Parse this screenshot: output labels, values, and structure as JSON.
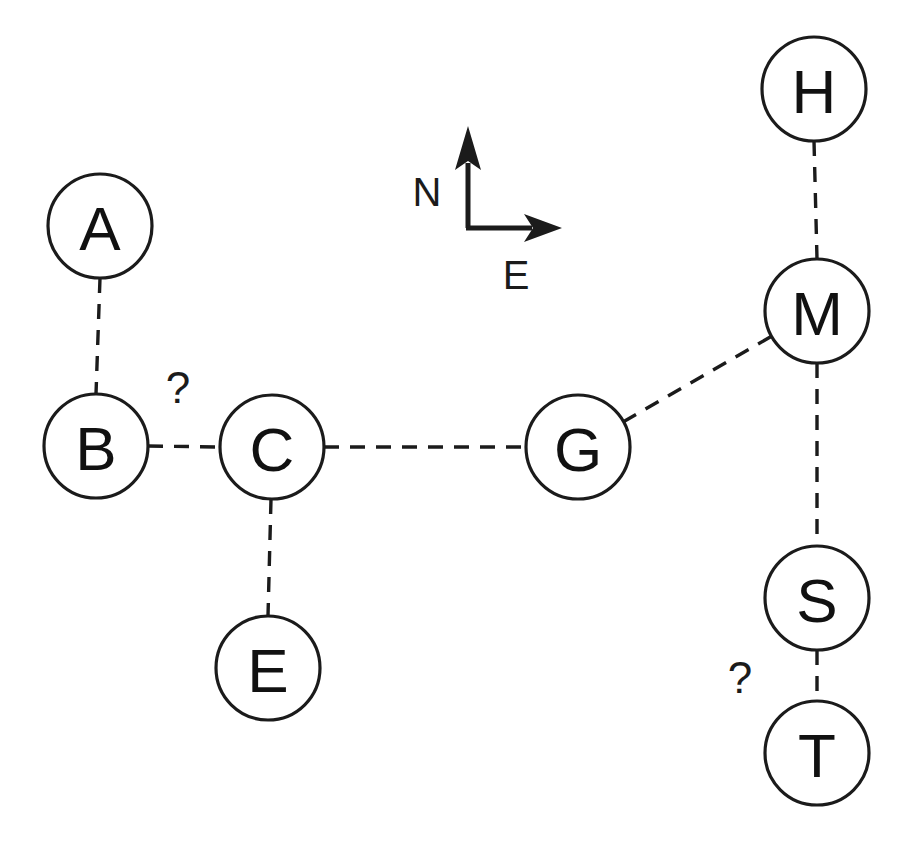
{
  "diagram": {
    "background_color": "#ffffff",
    "stroke_color": "#1b1b1b",
    "node_radius": 52,
    "nodes": [
      {
        "id": "A",
        "label": "A",
        "cx": 100,
        "cy": 226
      },
      {
        "id": "B",
        "label": "B",
        "cx": 96,
        "cy": 446
      },
      {
        "id": "C",
        "label": "C",
        "cx": 272,
        "cy": 447
      },
      {
        "id": "E",
        "label": "E",
        "cx": 268,
        "cy": 668
      },
      {
        "id": "G",
        "label": "G",
        "cx": 578,
        "cy": 447
      },
      {
        "id": "H",
        "label": "H",
        "cx": 814,
        "cy": 89
      },
      {
        "id": "M",
        "label": "M",
        "cx": 817,
        "cy": 311
      },
      {
        "id": "S",
        "label": "S",
        "cx": 817,
        "cy": 598
      },
      {
        "id": "T",
        "label": "T",
        "cx": 817,
        "cy": 753
      }
    ],
    "edges": [
      {
        "from": "A",
        "to": "B",
        "style": "dashed",
        "label": ""
      },
      {
        "from": "B",
        "to": "C",
        "style": "dashed",
        "label": "?"
      },
      {
        "from": "C",
        "to": "E",
        "style": "dashed",
        "label": ""
      },
      {
        "from": "C",
        "to": "G",
        "style": "dashed",
        "label": ""
      },
      {
        "from": "G",
        "to": "M",
        "style": "dashed",
        "label": ""
      },
      {
        "from": "H",
        "to": "M",
        "style": "dashed",
        "label": ""
      },
      {
        "from": "M",
        "to": "S",
        "style": "dashed",
        "label": ""
      },
      {
        "from": "S",
        "to": "T",
        "style": "dashed",
        "label": "?"
      }
    ],
    "edge_labels": [
      {
        "id": "bc",
        "text": "?",
        "x": 178,
        "y": 387
      },
      {
        "id": "st",
        "text": "?",
        "x": 740,
        "y": 677
      }
    ],
    "compass": {
      "north_label": "N",
      "east_label": "E",
      "corner_x": 468,
      "corner_y": 228,
      "north_tip_y": 126,
      "east_tip_x": 562,
      "north_label_x": 427,
      "north_label_y": 192,
      "east_label_x": 516,
      "east_label_y": 275
    }
  }
}
